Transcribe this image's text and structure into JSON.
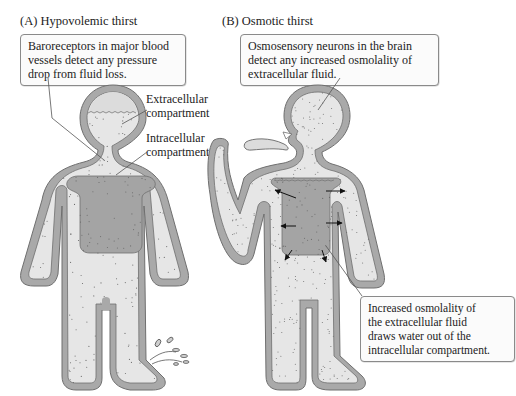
{
  "figure": {
    "panels": [
      {
        "id": "A",
        "title": "(A)  Hypovolemic thirst",
        "callout": [
          "Baroreceptors in major blood",
          "vessels detect any pressure",
          "drop from fluid loss."
        ],
        "labels": {
          "extracellular": [
            "Extracellular",
            "compartment"
          ],
          "intracellular": [
            "Intracellular",
            "compartment"
          ]
        }
      },
      {
        "id": "B",
        "title": "(B)  Osmotic thirst",
        "callout_top": [
          "Osmosensory neurons in the brain",
          "detect any increased osmolality of",
          "extracellular fluid."
        ],
        "callout_bottom": [
          "Increased osmolality of",
          "the extracellular fluid",
          "draws water out of the",
          "intracellular compartment."
        ]
      }
    ],
    "colors": {
      "skin": "#a9a9a9",
      "skin_edge": "#6f6f6f",
      "extracellular": "#e6e6e6",
      "intracellular": "#a4a4a4",
      "dots": "#6a6a6a",
      "leader_line": "#555555"
    }
  }
}
